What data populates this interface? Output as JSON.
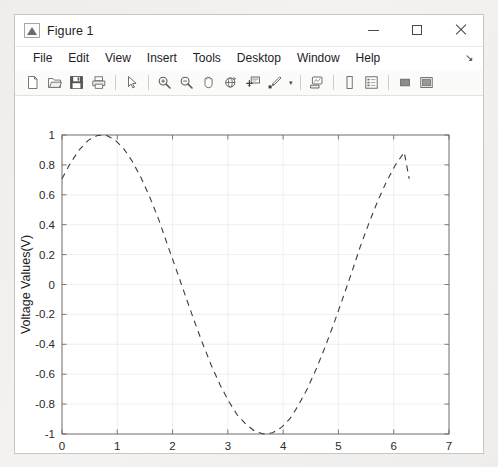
{
  "window": {
    "title": "Figure 1",
    "icon": "matlab-figure-icon",
    "controls": {
      "minimize": "minimize-icon",
      "maximize": "maximize-icon",
      "close": "close-icon"
    }
  },
  "menu": {
    "items": [
      {
        "label": "File"
      },
      {
        "label": "Edit"
      },
      {
        "label": "View"
      },
      {
        "label": "Insert"
      },
      {
        "label": "Tools"
      },
      {
        "label": "Desktop"
      },
      {
        "label": "Window"
      },
      {
        "label": "Help"
      }
    ],
    "overflow_glyph": "↘"
  },
  "toolbar": {
    "buttons": [
      {
        "name": "new-figure-icon"
      },
      {
        "name": "open-file-icon"
      },
      {
        "name": "save-figure-icon"
      },
      {
        "name": "print-figure-icon"
      },
      {
        "name": "separator"
      },
      {
        "name": "pointer-select-icon"
      },
      {
        "name": "separator"
      },
      {
        "name": "zoom-in-icon"
      },
      {
        "name": "zoom-out-icon"
      },
      {
        "name": "pan-hand-icon"
      },
      {
        "name": "rotate-3d-icon"
      },
      {
        "name": "data-cursor-icon"
      },
      {
        "name": "brush-data-icon"
      },
      {
        "name": "brush-dropdown-caret"
      },
      {
        "name": "separator"
      },
      {
        "name": "link-plot-icon"
      },
      {
        "name": "separator"
      },
      {
        "name": "insert-colorbar-icon"
      },
      {
        "name": "insert-legend-icon"
      },
      {
        "name": "separator"
      },
      {
        "name": "hide-plot-tools-icon"
      },
      {
        "name": "show-plot-tools-icon"
      }
    ]
  },
  "chart_data": {
    "type": "line",
    "title": "",
    "xlabel": "Time(s)",
    "ylabel": "Voltage Values(V)",
    "xlim": [
      0,
      7
    ],
    "ylim": [
      -1,
      1
    ],
    "xticks": [
      0,
      1,
      2,
      3,
      4,
      5,
      6,
      7
    ],
    "yticks": [
      -1,
      -0.8,
      -0.6,
      -0.4,
      -0.2,
      0,
      0.2,
      0.4,
      0.6,
      0.8,
      1
    ],
    "xticklabels": [
      "0",
      "1",
      "2",
      "3",
      "4",
      "5",
      "6",
      "7"
    ],
    "yticklabels": [
      "-1",
      "-0.8",
      "-0.6",
      "-0.4",
      "-0.2",
      "0",
      "0.2",
      "0.4",
      "0.6",
      "0.8",
      "1"
    ],
    "grid": true,
    "legend": null,
    "series": [
      {
        "name": "voltage",
        "linestyle": "dashed",
        "color": "#3c3c3c",
        "linewidth": 1.1,
        "expression": "sin(t + pi/4)",
        "x": [
          0.0,
          0.16,
          0.32,
          0.48,
          0.64,
          0.79,
          0.95,
          1.11,
          1.27,
          1.43,
          1.59,
          1.75,
          1.9,
          2.06,
          2.22,
          2.38,
          2.54,
          2.7,
          2.86,
          3.02,
          3.17,
          3.33,
          3.49,
          3.65,
          3.81,
          3.97,
          4.13,
          4.28,
          4.44,
          4.6,
          4.76,
          4.92,
          5.08,
          5.24,
          5.39,
          5.55,
          5.71,
          5.87,
          6.03,
          6.19,
          6.28
        ],
        "y": [
          0.707,
          0.817,
          0.904,
          0.966,
          0.997,
          1.0,
          0.97,
          0.912,
          0.825,
          0.714,
          0.582,
          0.434,
          0.274,
          0.107,
          -0.063,
          -0.231,
          -0.391,
          -0.54,
          -0.672,
          -0.784,
          -0.873,
          -0.936,
          -0.982,
          -1.0,
          -0.992,
          -0.956,
          -0.894,
          -0.806,
          -0.695,
          -0.564,
          -0.417,
          -0.258,
          -0.091,
          0.08,
          0.248,
          0.409,
          0.558,
          0.689,
          0.799,
          0.885,
          0.707
        ]
      }
    ]
  }
}
